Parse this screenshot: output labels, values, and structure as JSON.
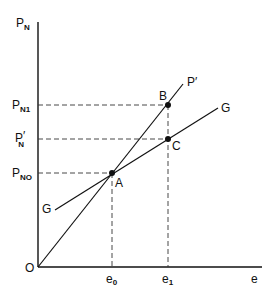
{
  "diagram": {
    "type": "economic-graph",
    "axes": {
      "y_label": "P",
      "y_label_sub": "N",
      "x_label": "e",
      "origin_label": "O"
    },
    "y_ticks": [
      {
        "main": "P",
        "sub": "N1",
        "prime": ""
      },
      {
        "main": "P",
        "sub": "N",
        "prime": "′"
      },
      {
        "main": "P",
        "sub": "NO",
        "prime": ""
      }
    ],
    "x_ticks": [
      {
        "main": "e",
        "sub": "0"
      },
      {
        "main": "e",
        "sub": "1"
      }
    ],
    "lines": [
      {
        "name": "P′",
        "label": "P′",
        "description": "ray from origin through A and B"
      },
      {
        "name": "G",
        "label": "G",
        "description": "flatter line through A and C"
      }
    ],
    "points": [
      {
        "label": "A"
      },
      {
        "label": "B"
      },
      {
        "label": "C"
      }
    ],
    "line_labels": {
      "p_prime": "P′",
      "g_upper": "G",
      "g_lower": "G"
    },
    "colors": {
      "ink": "#111111",
      "background": "#ffffff"
    }
  }
}
